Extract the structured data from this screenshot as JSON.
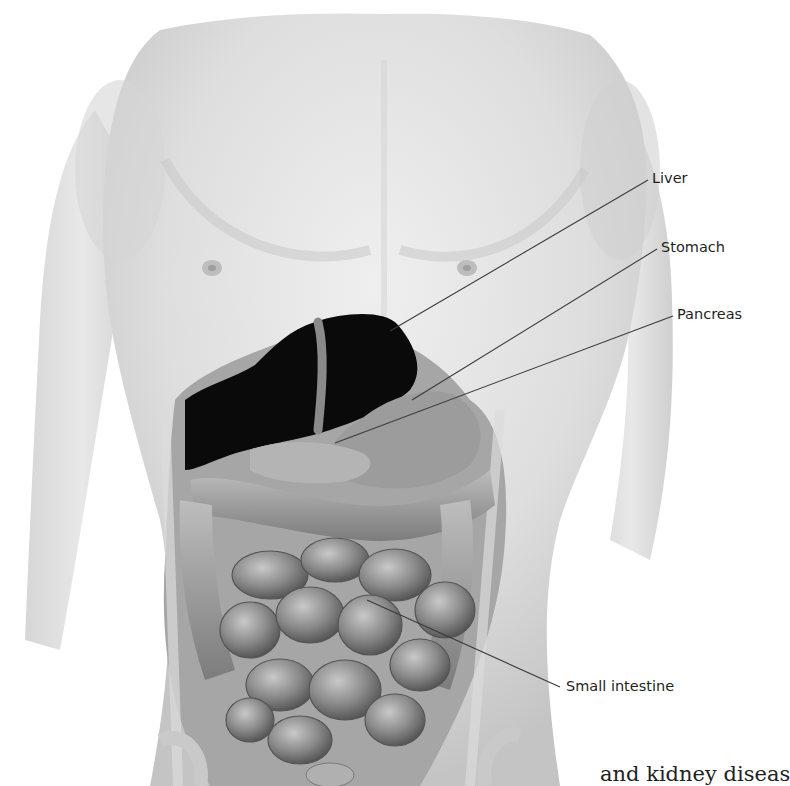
{
  "figure": {
    "colors": {
      "background": "#ffffff",
      "skin_light": "#e9e9e9",
      "skin_mid": "#d2d2d2",
      "skin_dark": "#b8b8b8",
      "liver_fill": "#0a0a0a",
      "organ_mid": "#8f8f8f",
      "organ_dark": "#5a5a5a",
      "leader_line": "#3a3a3a",
      "label_text": "#1f1f1f"
    },
    "labels": [
      {
        "id": "liver",
        "text": "Liver",
        "x": 652,
        "y": 171,
        "line": {
          "x1": 648,
          "y1": 180,
          "x2": 390,
          "y2": 331
        }
      },
      {
        "id": "stomach",
        "text": "Stomach",
        "x": 661,
        "y": 240,
        "line": {
          "x1": 657,
          "y1": 249,
          "x2": 412,
          "y2": 400
        }
      },
      {
        "id": "pancreas",
        "text": "Pancreas",
        "x": 677,
        "y": 307,
        "line": {
          "x1": 673,
          "y1": 316,
          "x2": 335,
          "y2": 443
        }
      },
      {
        "id": "small-intestine",
        "text": "Small intestine",
        "x": 566,
        "y": 679,
        "line": {
          "x1": 560,
          "y1": 687,
          "x2": 367,
          "y2": 600
        }
      }
    ]
  },
  "caption_fragment": "and kidney diseas"
}
